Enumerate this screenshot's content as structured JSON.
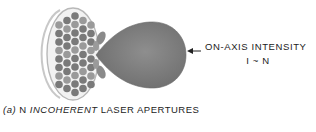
{
  "figure": {
    "annotation": {
      "label": "ON-AXIS INTENSITY",
      "relation": "I ~ N"
    },
    "caption": {
      "prefix": "(a)",
      "n": "N",
      "emphasis": "INCOHERENT",
      "rest": "LASER APERTURES"
    },
    "elements": {
      "aperture_array": "hexagonally packed circular laser apertures on a disk",
      "main_lobe": "radiation pattern main lobe",
      "side_lobes": "small side lobes near aperture",
      "arrow": "left-pointing arrow to lobe tip"
    },
    "colors": {
      "aperture_fill": "#7a7a7a",
      "aperture_light": "#9a9a9a",
      "disk_outline": "#b5b5b5",
      "lobe_fill": "#858585",
      "lobe_edge": "#6e6e6e",
      "text": "#222222"
    }
  }
}
